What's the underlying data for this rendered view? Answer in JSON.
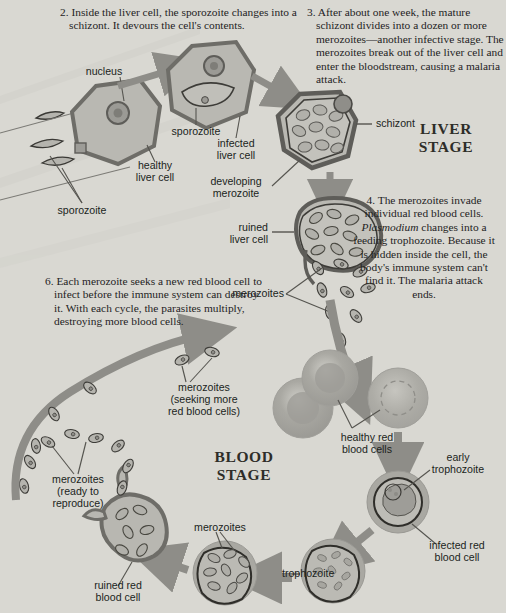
{
  "figure": {
    "background_color": "#d9d8d2",
    "cell_fill": "#b9b8b2",
    "cell_stroke": "#6a6a66",
    "arrow_color": "#8e8d88",
    "text_color": "#24231f"
  },
  "steps": [
    {
      "id": "step-2",
      "number": "2.",
      "text": "Inside the liver cell, the sporozoite changes into a schizont. It devours the cell's contents."
    },
    {
      "id": "step-3",
      "number": "3.",
      "text": "After about one week, the mature schizont divides into a dozen or more merozoites—another infective stage. The merozoites break out of the liver cell and enter the blood­stream, causing a malaria attack."
    },
    {
      "id": "step-4",
      "number": "4.",
      "text_before": "The merozoites invade individual red blood cells.",
      "emphasis": "Plasmodium",
      "text_after": "changes into a feeding trophozoite. Because it is hidden inside the cell, the body's immune system can't find it. The malaria attack ends."
    },
    {
      "id": "step-6",
      "number": "6.",
      "text": "Each merozoite seeks a new red blood cell to infect before the immune system can destroy it. With each cycle, the parasites multiply, destroying more blood cells."
    }
  ],
  "stage_headings": [
    {
      "id": "liver-stage",
      "line1": "LIVER",
      "line2": "STAGE"
    },
    {
      "id": "blood-stage",
      "line1": "BLOOD",
      "line2": "STAGE"
    }
  ],
  "labels": [
    {
      "id": "nucleus",
      "text": "nucleus"
    },
    {
      "id": "sporozoite-left",
      "text": "sporozoite"
    },
    {
      "id": "healthy-liver-cell",
      "line1": "healthy",
      "line2": "liver cell"
    },
    {
      "id": "sporozoite-inside",
      "text": "sporozoite"
    },
    {
      "id": "infected-liver-cell",
      "line1": "infected",
      "line2": "liver cell"
    },
    {
      "id": "developing-merozoite",
      "line1": "developing",
      "line2": "merozoite"
    },
    {
      "id": "schizont",
      "text": "schizont"
    },
    {
      "id": "ruined-liver-cell",
      "line1": "ruined",
      "line2": "liver cell"
    },
    {
      "id": "merozoites-liver",
      "text": "merozoites"
    },
    {
      "id": "merozoites-seeking",
      "line1": "merozoites",
      "line2": "(seeking more",
      "line3": "red blood cells)"
    },
    {
      "id": "merozoites-ready",
      "line1": "merozoites",
      "line2": "(ready to",
      "line3": "reproduce)"
    },
    {
      "id": "ruined-red-blood-cell",
      "line1": "ruined red",
      "line2": "blood cell"
    },
    {
      "id": "merozoites-blood",
      "text": "merozoites"
    },
    {
      "id": "healthy-red-blood-cells",
      "line1": "healthy red",
      "line2": "blood cells"
    },
    {
      "id": "early-trophozoite",
      "line1": "early",
      "line2": "trophozoite"
    },
    {
      "id": "infected-red-blood-cell",
      "line1": "infected red",
      "line2": "blood cell"
    },
    {
      "id": "trophozoite",
      "text": "trophozoite"
    }
  ]
}
